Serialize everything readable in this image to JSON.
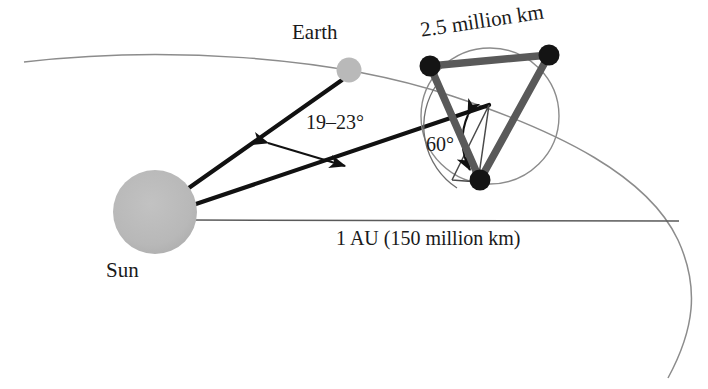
{
  "figure": {
    "type": "astronomy-orbit-diagram",
    "background_color": "#ffffff"
  },
  "bodies": {
    "sun": {
      "label": "Sun",
      "cx": 155,
      "cy": 212,
      "r": 42,
      "color": "#b9b9b9"
    },
    "earth": {
      "label": "Earth",
      "cx": 349,
      "cy": 70,
      "r": 12,
      "color": "#b9b9b9"
    }
  },
  "labels": {
    "separation": "2.5 million km",
    "trail_angle": "19–23°",
    "formation_angle": "60°",
    "baseline": "1 AU (150 million km)"
  },
  "formation": {
    "note": "three-spacecraft triangular formation",
    "spacecraft": [
      {
        "name": "spacecraft-top-left",
        "cx": 430,
        "cy": 66
      },
      {
        "name": "spacecraft-top-right",
        "cx": 549,
        "cy": 55
      },
      {
        "name": "spacecraft-bottom",
        "cx": 480,
        "cy": 180
      }
    ],
    "dot_radius": 10,
    "dot_color": "#1a1a1a",
    "edge_color": "#595959",
    "edge_width": 7,
    "guide_circle": {
      "cx": 490,
      "cy": 116,
      "rx": 69,
      "ry": 68
    }
  },
  "lines": {
    "sun_to_earth": {
      "x1": 175,
      "y1": 198,
      "x2": 341,
      "y2": 79,
      "color": "#111111",
      "width": 4
    },
    "sun_to_formation": {
      "x1": 180,
      "y1": 208,
      "x2": 489,
      "y2": 105,
      "color": "#111111",
      "width": 4
    },
    "baseline": {
      "x1": 190,
      "y1": 220,
      "x2": 679,
      "y2": 221,
      "color": "#5a5a5a",
      "width": 1.4
    }
  },
  "orbit": {
    "name": "earth-orbit-arc",
    "color": "#8c8c8c",
    "width": 1.4
  },
  "colors": {
    "body_gray": "#b9b9b9",
    "ink": "#111111",
    "edge_gray": "#595959",
    "orbit_gray": "#8c8c8c"
  }
}
